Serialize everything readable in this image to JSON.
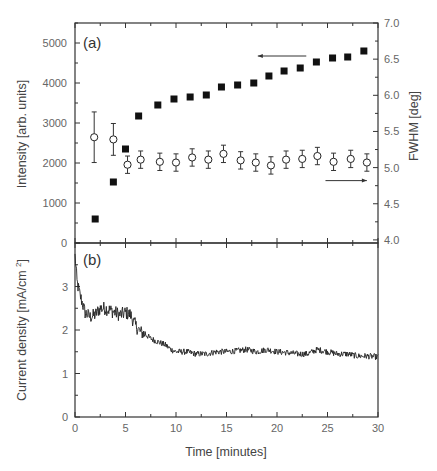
{
  "chart_data": [
    {
      "panel": "a",
      "type": "scatter",
      "panel_label": "(a)",
      "xlabel": "Time  [minutes]",
      "xlim": [
        0,
        30
      ],
      "ylabel_left": "Intensity  [arb. units]",
      "ylim_left": [
        0,
        5500
      ],
      "yticks_left": [
        "0",
        "1000",
        "2000",
        "3000",
        "4000",
        "5000"
      ],
      "ylabel_right": "FWHM  [deg]",
      "ylim_right": [
        4.0,
        7.0
      ],
      "yticks_right": [
        "4.0",
        "4.5",
        "5.0",
        "5.5",
        "6.0",
        "6.5",
        "7.0"
      ],
      "grid": false,
      "series": [
        {
          "name": "Intensity",
          "axis": "left",
          "marker": "filled-square",
          "x": [
            2.0,
            3.8,
            5.0,
            6.3,
            8.2,
            9.8,
            11.4,
            13.0,
            14.5,
            16.1,
            17.7,
            19.2,
            20.7,
            22.3,
            23.9,
            25.5,
            27.0,
            28.6
          ],
          "y": [
            600,
            1525,
            2350,
            3175,
            3450,
            3600,
            3650,
            3700,
            3900,
            3950,
            4000,
            4175,
            4300,
            4375,
            4525,
            4625,
            4650,
            4800
          ]
        },
        {
          "name": "FWHM",
          "axis": "right",
          "marker": "open-circle",
          "x": [
            1.9,
            3.8,
            5.2,
            6.5,
            8.4,
            10.0,
            11.6,
            13.2,
            14.7,
            16.4,
            17.9,
            19.4,
            20.9,
            22.5,
            24.0,
            25.6,
            27.3,
            28.9
          ],
          "y": [
            5.42,
            5.39,
            5.04,
            5.11,
            5.08,
            5.07,
            5.14,
            5.11,
            5.19,
            5.1,
            5.07,
            5.03,
            5.11,
            5.12,
            5.16,
            5.08,
            5.12,
            5.07
          ],
          "yerr": [
            0.35,
            0.22,
            0.12,
            0.12,
            0.12,
            0.12,
            0.12,
            0.12,
            0.12,
            0.12,
            0.12,
            0.12,
            0.12,
            0.12,
            0.12,
            0.12,
            0.12,
            0.12
          ]
        }
      ],
      "annotations": [
        {
          "type": "arrow",
          "direction": "left",
          "x_from": 22.9,
          "x_to": 18.1,
          "y_left": 4375,
          "refers_to": "Intensity (left axis)"
        },
        {
          "type": "arrow",
          "direction": "right",
          "x_from": 24.8,
          "x_to": 28.9,
          "y_right": 4.82,
          "refers_to": "FWHM (right axis)"
        }
      ]
    },
    {
      "panel": "b",
      "type": "line",
      "panel_label": "(b)",
      "xlabel": "Time  [minutes]",
      "xlim": [
        0,
        30
      ],
      "xticks": [
        "0",
        "5",
        "10",
        "15",
        "20",
        "25",
        "30"
      ],
      "ylabel": "Current density  [mA/cm²]",
      "ylim": [
        0,
        4
      ],
      "yticks": [
        "0",
        "1",
        "2",
        "3"
      ],
      "grid": false,
      "series": [
        {
          "name": "Current density",
          "x": [
            0,
            0.2,
            0.5,
            1.0,
            1.5,
            2.0,
            2.5,
            3.0,
            3.5,
            4.0,
            4.5,
            5.0,
            5.5,
            6.0,
            6.5,
            7.0,
            7.5,
            8.0,
            8.5,
            9.0,
            9.5,
            10.0,
            11.0,
            12.0,
            13.0,
            14.0,
            15.0,
            16.0,
            17.0,
            18.0,
            19.0,
            20.0,
            21.0,
            22.0,
            23.0,
            24.0,
            25.0,
            26.0,
            27.0,
            28.0,
            29.0,
            30.0
          ],
          "y": [
            3.75,
            3.1,
            2.8,
            2.4,
            2.3,
            2.35,
            2.5,
            2.5,
            2.45,
            2.4,
            2.35,
            2.4,
            2.35,
            2.1,
            1.95,
            1.9,
            1.8,
            1.75,
            1.7,
            1.65,
            1.55,
            1.5,
            1.5,
            1.45,
            1.45,
            1.5,
            1.5,
            1.52,
            1.55,
            1.5,
            1.55,
            1.5,
            1.48,
            1.45,
            1.45,
            1.55,
            1.5,
            1.45,
            1.45,
            1.4,
            1.4,
            1.38
          ]
        }
      ]
    }
  ]
}
